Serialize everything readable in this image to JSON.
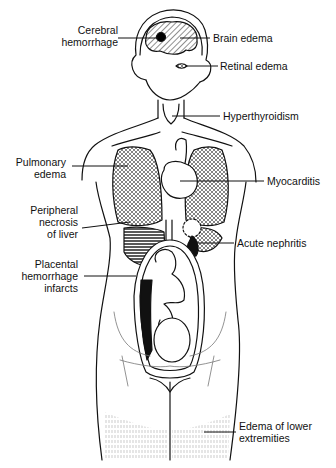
{
  "diagram": {
    "type": "anatomical-illustration",
    "line_color": "#111111",
    "background": "#ffffff",
    "labels": [
      {
        "id": "cerebral-hemorrhage",
        "lines": [
          "Cerebral",
          "hemorrhage"
        ],
        "side": "left"
      },
      {
        "id": "brain-edema",
        "lines": [
          "Brain edema"
        ],
        "side": "right"
      },
      {
        "id": "retinal-edema",
        "lines": [
          "Retinal edema"
        ],
        "side": "right"
      },
      {
        "id": "hyperthyroidism",
        "lines": [
          "Hyperthyroidism"
        ],
        "side": "right"
      },
      {
        "id": "pulmonary-edema",
        "lines": [
          "Pulmonary",
          "edema"
        ],
        "side": "left"
      },
      {
        "id": "myocarditis",
        "lines": [
          "Myocarditis"
        ],
        "side": "right"
      },
      {
        "id": "peripheral-necrosis-of-liver",
        "lines": [
          "Peripheral",
          "necrosis",
          "of liver"
        ],
        "side": "left"
      },
      {
        "id": "acute-nephritis",
        "lines": [
          "Acute nephritis"
        ],
        "side": "right"
      },
      {
        "id": "placental-hemorrhage-infarcts",
        "lines": [
          "Placental",
          "hemorrhage",
          "infarcts"
        ],
        "side": "left"
      },
      {
        "id": "edema-of-lower-extremities",
        "lines": [
          "Edema of lower",
          "extremities"
        ],
        "side": "right"
      }
    ]
  }
}
